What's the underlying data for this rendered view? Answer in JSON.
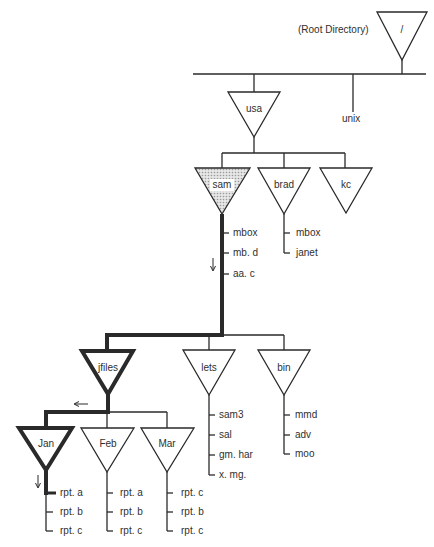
{
  "root": {
    "name": "/",
    "caption": "(Root Directory)"
  },
  "level1": {
    "dirs": [
      {
        "name": "usa"
      }
    ],
    "files": [
      {
        "name": "unix"
      }
    ]
  },
  "usa_children": [
    {
      "name": "sam",
      "highlighted": true,
      "files": [
        "mbox",
        "mb. d",
        "aa. c"
      ]
    },
    {
      "name": "brad",
      "files": [
        "mbox",
        "janet"
      ]
    },
    {
      "name": "kc",
      "files": []
    }
  ],
  "sam_children": [
    {
      "name": "jfiles",
      "on_path": true
    },
    {
      "name": "lets",
      "files": [
        "sam3",
        "sal",
        "gm. har",
        "x. mg."
      ]
    },
    {
      "name": "bin",
      "files": [
        "mmd",
        "adv",
        "moo"
      ]
    }
  ],
  "jfiles_children": [
    {
      "name": "Jan",
      "on_path": true,
      "files": [
        "rpt. a",
        "rpt. b",
        "rpt. c"
      ]
    },
    {
      "name": "Feb",
      "files": [
        "rpt. a",
        "rpt. b",
        "rpt. c"
      ]
    },
    {
      "name": "Mar",
      "files": [
        "rpt. c",
        "rpt. b",
        "rpt. c"
      ]
    }
  ],
  "arrows": [
    {
      "location": "beside sam files",
      "direction": "down"
    },
    {
      "location": "above jfiles branch bar",
      "direction": "left"
    },
    {
      "location": "below Jan",
      "direction": "down"
    }
  ],
  "colors": {
    "line": "#2a2a2a",
    "highlight_fill": "#d4d4d4",
    "background": "#ffffff"
  }
}
